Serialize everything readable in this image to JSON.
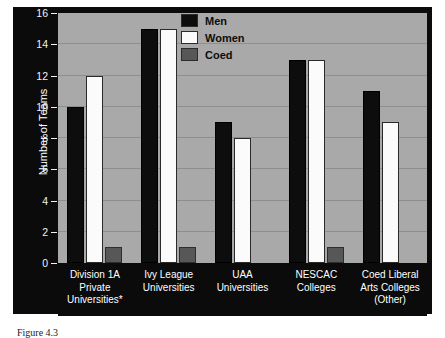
{
  "chart_data": {
    "type": "bar",
    "title": "",
    "xlabel": "",
    "ylabel": "Number of Teams",
    "ylim": [
      0,
      16
    ],
    "ytick_values": [
      0,
      2,
      4,
      6,
      8,
      10,
      12,
      14,
      16
    ],
    "ytick_labels": [
      "0",
      "2",
      "4",
      "6",
      "8",
      "10",
      "12",
      "14",
      "16"
    ],
    "grid": true,
    "legend_position": "top-center",
    "categories": [
      "Division 1A Private Universities*",
      "Ivy League Universities",
      "UAA Universities",
      "NESCAC Colleges",
      "Coed Liberal Arts Colleges (Other)"
    ],
    "category_lines": [
      [
        "Division 1A",
        "Private",
        "Universities*"
      ],
      [
        "Ivy League",
        "Universities"
      ],
      [
        "UAA",
        "Universities"
      ],
      [
        "NESCAC",
        "Colleges"
      ],
      [
        "Coed Liberal",
        "Arts Colleges",
        "(Other)"
      ]
    ],
    "series": [
      {
        "name": "Men",
        "color": "#0d0d0d",
        "values": [
          10,
          15,
          9,
          13,
          11
        ]
      },
      {
        "name": "Women",
        "color": "#fbfbfb",
        "values": [
          12,
          15,
          8,
          13,
          9
        ]
      },
      {
        "name": "Coed",
        "color": "#575757",
        "values": [
          1,
          1,
          0,
          1,
          0
        ]
      }
    ],
    "data_labels": [
      [
        "10",
        "12",
        "1"
      ],
      [
        "15",
        "15",
        "1"
      ],
      [
        "9",
        "8",
        "0"
      ],
      [
        "13",
        "13",
        "1"
      ],
      [
        "11",
        "9",
        "0"
      ]
    ]
  },
  "legend": {
    "items": [
      {
        "label": "Men",
        "swatch": "black"
      },
      {
        "label": "Women",
        "swatch": "white"
      },
      {
        "label": "Coed",
        "swatch": "gray"
      }
    ]
  },
  "axis": {
    "y_title": "Number of Teams"
  },
  "caption": {
    "text": "Figure 4.3"
  },
  "colors": {
    "plot_background": "#a9a9a9",
    "panel_background": "#0b0b0b",
    "gridline": "#8e8e8e",
    "men": "#0d0d0d",
    "women": "#fbfbfb",
    "coed": "#575757"
  }
}
